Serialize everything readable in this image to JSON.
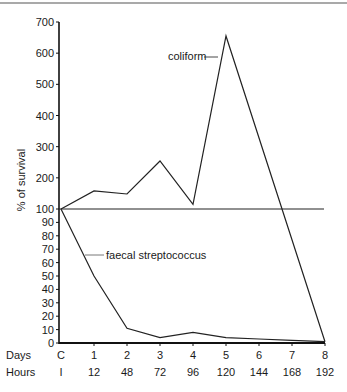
{
  "chart_data": {
    "type": "line",
    "title": "",
    "xlabel": "",
    "ylabel": "% of survival",
    "x_rows": [
      {
        "label": "Days",
        "ticks": [
          "C",
          "1",
          "2",
          "3",
          "4",
          "5",
          "6",
          "7",
          "8"
        ]
      },
      {
        "label": "Hours",
        "ticks": [
          "I",
          "12",
          "48",
          "72",
          "96",
          "120",
          "144",
          "168",
          "192"
        ]
      }
    ],
    "y_scale": "broken",
    "y_ticks_lower": [
      0,
      10,
      20,
      30,
      40,
      50,
      60,
      70,
      80,
      90,
      100
    ],
    "y_ticks_upper": [
      200,
      300,
      400,
      500,
      600,
      700
    ],
    "ylim": [
      0,
      700
    ],
    "reference_line": {
      "y": 100,
      "label": "100% survival"
    },
    "grid": false,
    "legend": "inline annotations",
    "series": [
      {
        "name": "coliform",
        "x_index": [
          0,
          1,
          2,
          3,
          4,
          5,
          8
        ],
        "values": [
          100,
          158,
          148,
          254,
          115,
          655,
          1
        ]
      },
      {
        "name": "faecal streptococcus",
        "x_index": [
          0,
          1,
          2,
          3,
          4,
          5,
          6,
          7,
          8
        ],
        "values": [
          100,
          50,
          11,
          4,
          8,
          4,
          3,
          2,
          1
        ]
      }
    ]
  },
  "labels": {
    "ylabel": "% of survival",
    "days_row": "Days",
    "hours_row": "Hours",
    "coliform": "coliform",
    "faecal": "faecal streptococcus"
  }
}
